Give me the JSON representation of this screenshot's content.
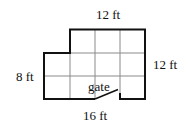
{
  "diagram": {
    "labels": {
      "top": "12 ft",
      "right": "12 ft",
      "left": "8 ft",
      "bottom": "16 ft",
      "gate": "gate"
    },
    "colors": {
      "outline": "#111111",
      "grid": "#888888"
    }
  }
}
